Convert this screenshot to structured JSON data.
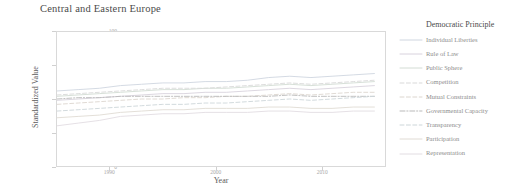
{
  "chart_data": {
    "type": "line",
    "title": "Central and Eastern Europe",
    "xlabel": "Year",
    "ylabel": "Standardized Value",
    "xlim": [
      1985,
      2016
    ],
    "ylim": [
      0,
      100
    ],
    "xticks": [
      "1990",
      "2000",
      "2010"
    ],
    "xtick_values": [
      1990,
      2000,
      2010
    ],
    "yticks": [
      "100",
      "75",
      "50",
      "25",
      "0"
    ],
    "ytick_values": [
      100,
      75,
      50,
      25,
      0
    ],
    "grid": false,
    "legend_position": "right",
    "legend_title": "Democratic Principle",
    "x": [
      1985,
      1987,
      1989,
      1991,
      1993,
      1995,
      1997,
      1999,
      2001,
      2003,
      2005,
      2007,
      2009,
      2011,
      2013,
      2015
    ],
    "series": [
      {
        "name": "Individual Liberties",
        "color": "#cfd6e0",
        "dash": "solid",
        "values": [
          56,
          57,
          58,
          60,
          61,
          62,
          62,
          63,
          63,
          64,
          66,
          67,
          66,
          67,
          68,
          69
        ]
      },
      {
        "name": "Rule of Law",
        "color": "#d8d2dd",
        "dash": "solid",
        "values": [
          49,
          50,
          51,
          52,
          53,
          54,
          54,
          55,
          55,
          56,
          57,
          58,
          57,
          58,
          59,
          60
        ]
      },
      {
        "name": "Public Sphere",
        "color": "#d3dcd4",
        "dash": "solid",
        "values": [
          52,
          53,
          54,
          55,
          56,
          57,
          57,
          58,
          58,
          59,
          60,
          61,
          60,
          61,
          62,
          63
        ]
      },
      {
        "name": "Competition",
        "color": "#d9d9d9",
        "dash": "dashed",
        "values": [
          53,
          54,
          55,
          56,
          57,
          58,
          58,
          58,
          59,
          60,
          61,
          62,
          61,
          62,
          63,
          64
        ]
      },
      {
        "name": "Mutual Constraints",
        "color": "#dcd6cf",
        "dash": "dashed",
        "values": [
          46,
          47,
          48,
          49,
          50,
          50,
          51,
          51,
          52,
          52,
          53,
          54,
          53,
          54,
          55,
          55
        ]
      },
      {
        "name": "Governmental Capacity",
        "color": "#b9b9b9",
        "dash": "dashdot",
        "values": [
          50,
          51,
          51,
          52,
          52,
          52,
          52,
          52,
          52,
          52,
          52,
          53,
          52,
          52,
          52,
          52
        ]
      },
      {
        "name": "Transparency",
        "color": "#cdd6d9",
        "dash": "dashed",
        "values": [
          41,
          42,
          43,
          44,
          45,
          46,
          46,
          47,
          47,
          48,
          49,
          50,
          49,
          50,
          51,
          52
        ]
      },
      {
        "name": "Participation",
        "color": "#e0dbd4",
        "dash": "solid",
        "values": [
          36,
          37,
          38,
          40,
          41,
          42,
          42,
          43,
          43,
          43,
          44,
          44,
          43,
          43,
          44,
          44
        ]
      },
      {
        "name": "Representation",
        "color": "#e2dde2",
        "dash": "solid",
        "values": [
          30,
          32,
          34,
          37,
          38,
          39,
          39,
          40,
          40,
          40,
          41,
          41,
          40,
          40,
          41,
          41
        ]
      }
    ]
  }
}
